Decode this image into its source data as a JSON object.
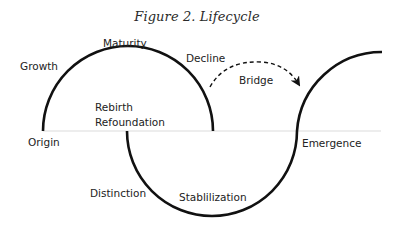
{
  "figure": {
    "title": "Figure 2. Lifecycle",
    "labels": {
      "growth": "Growth",
      "maturity": "Maturity",
      "decline": "Decline",
      "bridge": "Bridge",
      "rebirth": "Rebirth",
      "refoundation": "Refoundation",
      "origin": "Origin",
      "emergence": "Emergence",
      "distinction": "Distinction",
      "stabilization": "Stablilization"
    },
    "colors": {
      "curve": "#111111",
      "baseline": "#dcdcdc",
      "text": "#222222"
    }
  }
}
